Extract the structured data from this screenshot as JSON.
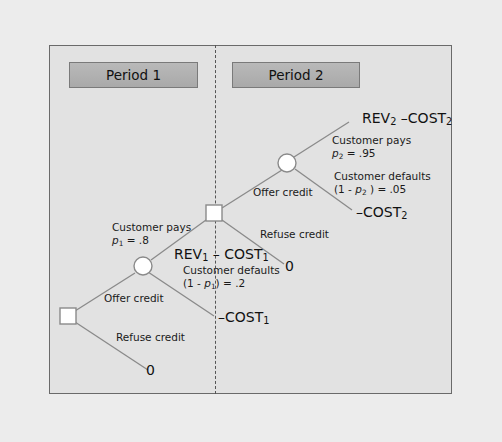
{
  "periods": [
    {
      "label": "Period 1"
    },
    {
      "label": "Period 2"
    }
  ],
  "branches": {
    "p1_offer_credit": "Offer credit",
    "p1_refuse_credit": "Refuse credit",
    "p1_customer_pays": "Customer pays",
    "p1_pays_prob_var": "p",
    "p1_pays_prob_sub": "1",
    "p1_pays_prob_val": " = .8",
    "p1_customer_defaults": "Customer defaults",
    "p1_defaults_prob_prefix": "(1 - ",
    "p1_defaults_prob_var": "p",
    "p1_defaults_prob_sub": "1",
    "p1_defaults_prob_val": ") = .2",
    "p2_offer_credit": "Offer credit",
    "p2_refuse_credit": "Refuse credit",
    "p2_customer_pays": "Customer pays",
    "p2_pays_prob_var": "p",
    "p2_pays_prob_sub": "2",
    "p2_pays_prob_val": " = .95",
    "p2_customer_defaults": "Customer defaults",
    "p2_defaults_prob_prefix": "(1 - ",
    "p2_defaults_prob_var": "p",
    "p2_defaults_prob_sub": "2",
    "p2_defaults_prob_val": " ) = .05"
  },
  "payoffs": {
    "rev2_cost2": {
      "a": "REV",
      "a_sub": "2",
      "b": " –COST",
      "b_sub": "2"
    },
    "neg_cost2": {
      "a": "–COST",
      "a_sub": "2"
    },
    "p2_refuse_zero": "0",
    "rev1_cost1": {
      "a": "REV",
      "a_sub": "1",
      "b": " – COST",
      "b_sub": "1"
    },
    "neg_cost1": {
      "a": "–COST",
      "a_sub": "1"
    },
    "p1_refuse_zero": "0"
  },
  "colors": {
    "line": "#8a8a8a",
    "node_fill": "#ffffff",
    "node_stroke": "#8a8a8a"
  }
}
